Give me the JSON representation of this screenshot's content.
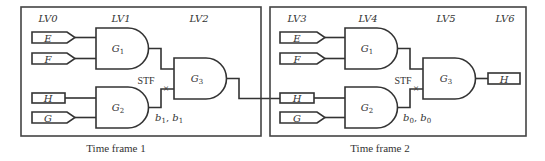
{
  "frames": [
    {
      "caption": "Time frame 1",
      "levels": [
        "LV0",
        "LV1",
        "LV2"
      ],
      "inputs": {
        "e": "E",
        "f": "F",
        "h": "H",
        "g": "G"
      },
      "gates": {
        "g1": {
          "name": "G",
          "sub": "1"
        },
        "g2": {
          "name": "G",
          "sub": "2"
        },
        "g3": {
          "name": "G",
          "sub": "3"
        }
      },
      "fault_label": "STF",
      "fault_mark": "×",
      "values": {
        "a": "b",
        "a_sub": "1",
        "sep": ", ",
        "b": "b",
        "b_sub": "1"
      }
    },
    {
      "caption": "Time frame 2",
      "levels": [
        "LV3",
        "LV4",
        "LV5",
        "LV6"
      ],
      "inputs": {
        "e": "E",
        "f": "F",
        "h": "H",
        "g": "G"
      },
      "gates": {
        "g1": {
          "name": "G",
          "sub": "1"
        },
        "g2": {
          "name": "G",
          "sub": "2"
        },
        "g3": {
          "name": "G",
          "sub": "3"
        }
      },
      "fault_label": "STF",
      "fault_mark": "×",
      "values": {
        "a": "b",
        "a_sub": "0",
        "sep": ", ",
        "b": "b",
        "b_sub": "0"
      },
      "output": "H"
    }
  ]
}
